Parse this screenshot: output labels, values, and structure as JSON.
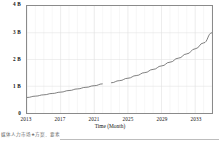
{
  "chart_data": {
    "type": "line",
    "title": "",
    "subtitle": "",
    "xlabel": "Time (Month)",
    "ylabel": "",
    "xlim": [
      2013,
      2035
    ],
    "ylim": [
      0,
      4
    ],
    "grid": true,
    "legend": "none",
    "y_tick_labels": [
      "0",
      "1 B",
      "2 B",
      "3 B",
      "4 B"
    ],
    "y_tick_values": [
      0,
      1,
      2,
      3,
      4
    ],
    "x_tick_labels": [
      "2013",
      "2017",
      "2021",
      "2025",
      "2029",
      "2033"
    ],
    "x_tick_values": [
      2013,
      2017,
      2021,
      2025,
      2029,
      2033
    ],
    "x_minor_step": 1,
    "units": "B",
    "series": [
      {
        "name": "value",
        "color": "#555555",
        "x": [
          2013,
          2014,
          2015,
          2016,
          2017,
          2018,
          2019,
          2020,
          2021,
          2022,
          2023,
          2024,
          2025,
          2026,
          2027,
          2028,
          2029,
          2030,
          2031,
          2032,
          2033,
          2034,
          2035
        ],
        "values": [
          0.58,
          0.63,
          0.68,
          0.73,
          0.78,
          0.84,
          0.9,
          0.96,
          1.02,
          1.09,
          1.13,
          1.21,
          1.3,
          1.4,
          1.51,
          1.63,
          1.76,
          1.9,
          2.05,
          2.21,
          2.4,
          2.62,
          3.0
        ],
        "break_at": 2022.5
      }
    ],
    "annotations": []
  },
  "footer": {
    "caption": "媒体人力市场★方案．要素",
    "rule": true
  }
}
